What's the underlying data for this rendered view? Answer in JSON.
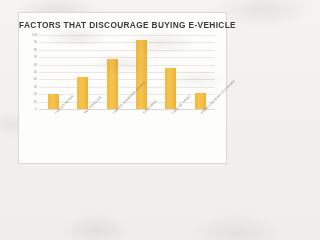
{
  "chart_data": {
    "type": "bar",
    "title": "FACTORS THAT DISCOURAGE BUYING E-VEHICLE",
    "categories": [
      "LIMITED RANGE",
      "NOT POPULAR",
      "LIMITED CHARGING POINTS",
      "EXPENSIVE",
      "LACK OF TRUST",
      "UNWILLINGNESS TO CHANGE"
    ],
    "values": [
      20,
      43,
      67,
      93,
      55,
      21
    ],
    "xlabel": "",
    "ylabel": "",
    "ylim": [
      0,
      100
    ],
    "yticks": [
      100,
      90,
      80,
      70,
      60,
      50,
      40,
      30,
      20,
      10,
      0
    ],
    "grid": true,
    "legend": false,
    "bar_color": "#F5BE41"
  }
}
